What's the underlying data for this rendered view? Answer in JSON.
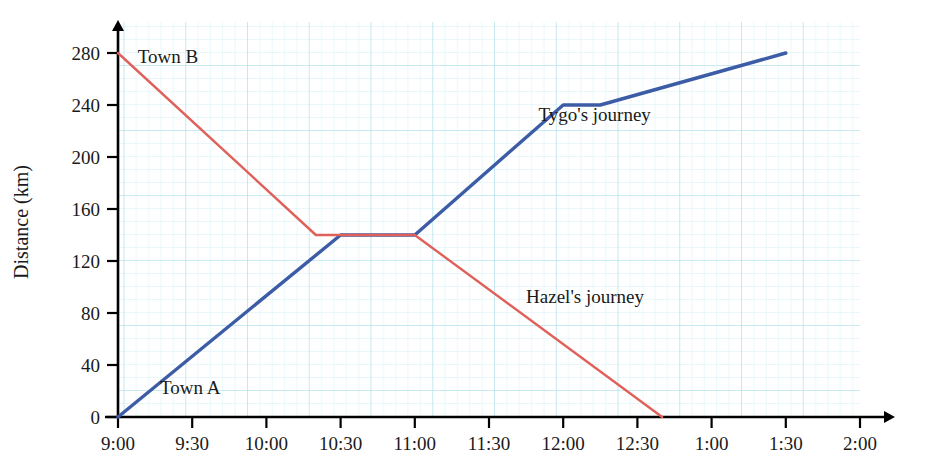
{
  "chart_data": {
    "type": "line",
    "title": "",
    "xlabel": "",
    "ylabel": "Distance (km)",
    "grid": true,
    "grid_color": "#aadde8",
    "grid_minor_color": "#cfeef5",
    "legend": "inline-annotations",
    "xlim": [
      "9:00",
      "2:00"
    ],
    "ylim": [
      0,
      280
    ],
    "y_ticks": [
      0,
      40,
      80,
      120,
      160,
      200,
      240,
      280
    ],
    "y_tick_labels": [
      "0",
      "40",
      "80",
      "120",
      "160",
      "200",
      "240",
      "280"
    ],
    "x_ticks": [
      "9:00",
      "9:30",
      "10:00",
      "10:30",
      "11:00",
      "11:30",
      "12:00",
      "12:30",
      "1:00",
      "1:30",
      "2:00"
    ],
    "x_tick_labels": [
      "9:00",
      "9:30",
      "10:00",
      "10:30",
      "11:00",
      "11:30",
      "12:00",
      "12:30",
      "1:00",
      "1:30",
      "2:00"
    ],
    "series": [
      {
        "name": "Tygo's journey",
        "color": "#3c5ca6",
        "label": "Tygo's journey",
        "label_x": "11:50",
        "label_y": 228,
        "points": [
          {
            "x": "9:00",
            "y": 0
          },
          {
            "x": "10:30",
            "y": 140
          },
          {
            "x": "11:00",
            "y": 140
          },
          {
            "x": "12:00",
            "y": 240
          },
          {
            "x": "12:15",
            "y": 240
          },
          {
            "x": "1:30",
            "y": 280
          }
        ]
      },
      {
        "name": "Hazel's journey",
        "color": "#e0605a",
        "label": "Hazel's journey",
        "label_x": "11:45",
        "label_y": 88,
        "points": [
          {
            "x": "9:00",
            "y": 280
          },
          {
            "x": "10:20",
            "y": 140
          },
          {
            "x": "11:00",
            "y": 140
          },
          {
            "x": "12:40",
            "y": 0
          }
        ]
      }
    ],
    "annotations": [
      {
        "name": "town-b",
        "text": "Town B",
        "x": "9:08",
        "y": 272
      },
      {
        "name": "town-a",
        "text": "Town A",
        "x": "9:17",
        "y": 18
      }
    ]
  }
}
